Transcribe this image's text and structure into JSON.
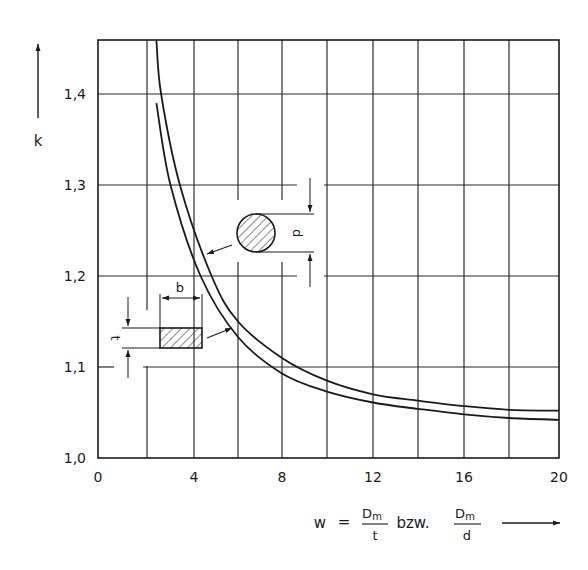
{
  "chart_data": {
    "type": "line",
    "title": "",
    "xlabel": "w = Dm/t bzw. Dm/d",
    "ylabel": "k",
    "xlim": [
      0,
      20
    ],
    "ylim": [
      1.0,
      1.46
    ],
    "grid": true,
    "x_ticks": [
      0,
      4,
      8,
      12,
      16,
      20
    ],
    "x_tick_labels": [
      "0",
      "4",
      "8",
      "12",
      "16",
      "20"
    ],
    "x_gridlines": [
      0,
      2,
      4,
      6,
      8,
      10,
      12,
      14,
      16,
      18,
      20
    ],
    "y_ticks": [
      1.0,
      1.1,
      1.2,
      1.3,
      1.4
    ],
    "y_tick_labels": [
      "1,0",
      "1,1",
      "1,2",
      "1,3",
      "1,4"
    ],
    "series": [
      {
        "name": "circular cross-section (d)",
        "x": [
          2.4,
          2.6,
          3.4,
          4.8,
          6,
          8,
          10,
          12,
          14,
          16,
          18,
          20
        ],
        "y": [
          1.46,
          1.4,
          1.3,
          1.2,
          1.15,
          1.11,
          1.085,
          1.07,
          1.063,
          1.057,
          1.053,
          1.052
        ]
      },
      {
        "name": "rectangular cross-section (b x t)",
        "x": [
          2.4,
          3.0,
          4.3,
          6,
          8,
          10,
          12,
          14,
          16,
          18,
          20
        ],
        "y": [
          1.39,
          1.3,
          1.2,
          1.133,
          1.093,
          1.073,
          1.061,
          1.054,
          1.048,
          1.044,
          1.042
        ]
      }
    ],
    "annotations": [
      {
        "type": "figure",
        "shape": "circle",
        "label": "d",
        "points_to": "circular cross-section (d)"
      },
      {
        "type": "figure",
        "shape": "rectangle",
        "labels": [
          "b",
          "t"
        ],
        "points_to": "rectangular cross-section (b x t)"
      }
    ]
  },
  "axis": {
    "y_label": "k",
    "x_formula": {
      "lhs": "w",
      "eq": "=",
      "frac1_num": "D",
      "frac1_sub": "m",
      "frac1_den": "t",
      "conj": "bzw.",
      "frac2_num": "D",
      "frac2_sub": "m",
      "frac2_den": "d"
    }
  },
  "figures": {
    "circle_dim_label": "d",
    "rect_width_label": "b",
    "rect_height_label": "t"
  },
  "colors": {
    "ink": "#1a1a1a",
    "grid": "#2a2a2a",
    "background": "#ffffff"
  }
}
